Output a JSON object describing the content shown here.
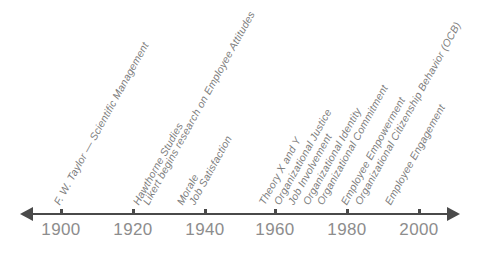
{
  "figure": {
    "type": "timeline",
    "background_color": "#ffffff",
    "axis_color": "#4a4a4a",
    "label_color": "#7d7d7d",
    "year_color": "#8d8d8d"
  },
  "axis": {
    "orientation": "horizontal",
    "left_arrow": "arrow-left",
    "right_arrow": "arrow-right",
    "year_ticks": [
      {
        "year": "1900",
        "x": 61
      },
      {
        "year": "1920",
        "x": 133
      },
      {
        "year": "1940",
        "x": 205
      },
      {
        "year": "1960",
        "x": 275
      },
      {
        "year": "1980",
        "x": 347
      },
      {
        "year": "2000",
        "x": 419
      }
    ]
  },
  "events": [
    {
      "label": "F. W. Taylor — Scientific Management",
      "x": 61
    },
    {
      "label": "Hawthorne Studies",
      "x": 140
    },
    {
      "label": "Likert begins research on Employee Attitudes",
      "x": 150
    },
    {
      "label": "Morale",
      "x": 184
    },
    {
      "label": "Job Satisfaction",
      "x": 196
    },
    {
      "label": "Theory X and Y",
      "x": 266
    },
    {
      "label": "Organizational Justice",
      "x": 281
    },
    {
      "label": "Job Involvement",
      "x": 295
    },
    {
      "label": "Organizational Identity",
      "x": 310
    },
    {
      "label": "Organizational Commitment",
      "x": 324
    },
    {
      "label": "Employee Empowerment",
      "x": 348
    },
    {
      "label": "Organizational Citizenship Behavior (OCB)",
      "x": 362
    },
    {
      "label": "Employee Engagement",
      "x": 392
    }
  ],
  "chart_data": {
    "type": "timeline",
    "title": "",
    "xlabel": "",
    "ylabel": "",
    "xlim": [
      1893,
      2007
    ],
    "tick_years": [
      1900,
      1920,
      1940,
      1960,
      1980,
      2000
    ],
    "grid": false,
    "legend": "none",
    "annotations": [
      {
        "year": 1900,
        "text": "F. W. Taylor — Scientific Management"
      },
      {
        "year": 1922,
        "text": "Hawthorne Studies"
      },
      {
        "year": 1925,
        "text": "Likert begins research on Employee Attitudes"
      },
      {
        "year": 1934,
        "text": "Morale"
      },
      {
        "year": 1938,
        "text": "Job Satisfaction"
      },
      {
        "year": 1957,
        "text": "Theory X and Y"
      },
      {
        "year": 1961,
        "text": "Organizational Justice"
      },
      {
        "year": 1965,
        "text": "Job Involvement"
      },
      {
        "year": 1969,
        "text": "Organizational Identity"
      },
      {
        "year": 1973,
        "text": "Organizational Commitment"
      },
      {
        "year": 1980,
        "text": "Employee Empowerment"
      },
      {
        "year": 1984,
        "text": "Organizational Citizenship Behavior (OCB)"
      },
      {
        "year": 1992,
        "text": "Employee Engagement"
      }
    ]
  }
}
